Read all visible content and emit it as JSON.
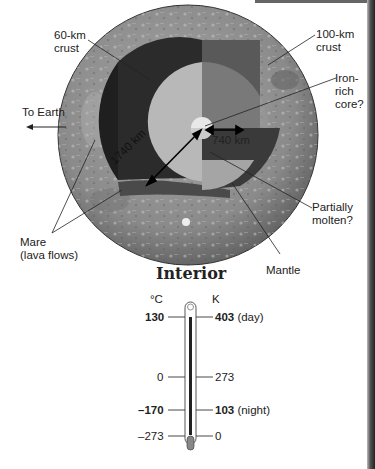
{
  "diagram": {
    "title": "Interior",
    "labels": {
      "crust_60": [
        "60-km",
        "crust"
      ],
      "crust_100": [
        "100-km",
        "crust"
      ],
      "core": [
        "Iron-",
        "rich",
        "core?"
      ],
      "to_earth": "To Earth",
      "radius_outer": "1740 km",
      "radius_inner": "740 km",
      "partially_molten": [
        "Partially",
        "molten?"
      ],
      "mare": [
        "Mare",
        "(lava flows)"
      ],
      "mantle": "Mantle"
    }
  },
  "thermometer": {
    "celsius_unit": "°C",
    "kelvin_unit": "K",
    "rows": [
      {
        "c": "130",
        "k": "403",
        "note": "(day)",
        "bold": true
      },
      {
        "c": "0",
        "k": "273",
        "note": "",
        "bold": false
      },
      {
        "c": "–170",
        "k": "103",
        "note": "(night)",
        "bold": true
      },
      {
        "c": "–273",
        "k": "0",
        "note": "",
        "bold": false
      }
    ]
  }
}
